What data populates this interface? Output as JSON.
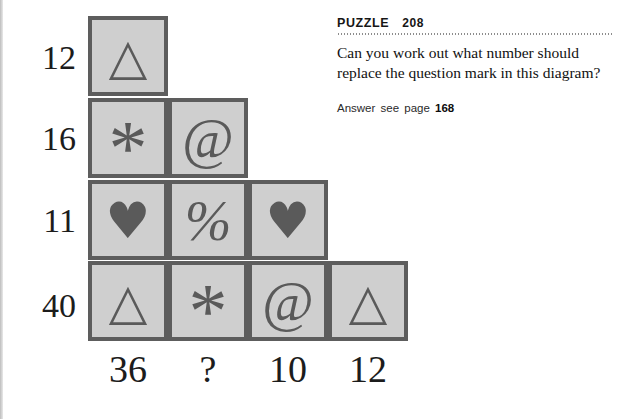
{
  "panel": {
    "label": "PUZZLE",
    "number": "208",
    "question": "Can you work out what number should replace the question mark in this diagram?",
    "answer_prefix": "Answer see page",
    "answer_page": "168"
  },
  "diagram": {
    "row_labels": [
      "12",
      "16",
      "11",
      "40"
    ],
    "column_labels": [
      "36",
      "?",
      "10",
      "12"
    ],
    "rows": [
      {
        "total": "12",
        "cells": [
          {
            "symbol": "triangle",
            "glyph": "△"
          }
        ]
      },
      {
        "total": "16",
        "cells": [
          {
            "symbol": "asterisk",
            "glyph": "*"
          },
          {
            "symbol": "at",
            "glyph": "@"
          }
        ]
      },
      {
        "total": "11",
        "cells": [
          {
            "symbol": "heart",
            "glyph": "♥"
          },
          {
            "symbol": "percent",
            "glyph": "%"
          },
          {
            "symbol": "heart",
            "glyph": "♥"
          }
        ]
      },
      {
        "total": "40",
        "cells": [
          {
            "symbol": "triangle",
            "glyph": "△"
          },
          {
            "symbol": "asterisk",
            "glyph": "*"
          },
          {
            "symbol": "at",
            "glyph": "@"
          },
          {
            "symbol": "triangle",
            "glyph": "△"
          }
        ]
      }
    ]
  },
  "colors": {
    "cell_fill": "#cfcfcf",
    "cell_border": "#5d5d5d",
    "glyph": "#5a5a5a",
    "text": "#1c1c1c"
  }
}
